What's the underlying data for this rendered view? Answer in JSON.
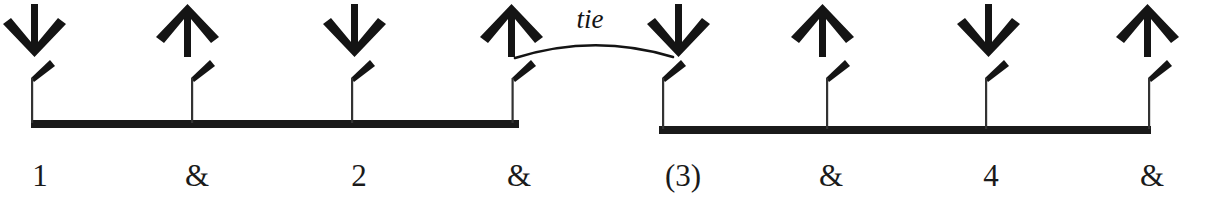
{
  "diagram": {
    "kind": "strumming-rhythm-notation",
    "ink_color": "#1a1a1a",
    "background_color": "#ffffff",
    "tie": {
      "label": "tie",
      "label_x": 590,
      "label_y": 6,
      "from_beat_index": 3,
      "to_beat_index": 4,
      "arc_start_x": 515,
      "arc_start_y": 58,
      "arc_peak_x": 594,
      "arc_peak_y": 40,
      "arc_end_x": 673,
      "arc_end_y": 57
    },
    "beams": [
      {
        "name": "beam-group-1",
        "x1": 31,
        "x2": 519,
        "y": 120,
        "thickness": 8
      },
      {
        "name": "beam-group-2",
        "x1": 659,
        "x2": 1151,
        "y": 126,
        "thickness": 8
      }
    ],
    "beats": [
      {
        "label": "1",
        "stroke": "down",
        "x": 31,
        "beam": 1,
        "label_x": 40,
        "label_y": 160
      },
      {
        "label": "&",
        "stroke": "up",
        "x": 191,
        "beam": 1,
        "label_x": 197,
        "label_y": 160
      },
      {
        "label": "2",
        "stroke": "down",
        "x": 351,
        "beam": 1,
        "label_x": 359,
        "label_y": 160
      },
      {
        "label": "&",
        "stroke": "up",
        "x": 515,
        "beam": 1,
        "label_x": 519,
        "label_y": 160
      },
      {
        "label": "(3)",
        "stroke": "down",
        "x": 662,
        "beam": 2,
        "label_x": 683,
        "label_y": 160
      },
      {
        "label": "&",
        "stroke": "up",
        "x": 826,
        "beam": 2,
        "label_x": 831,
        "label_y": 160
      },
      {
        "label": "4",
        "stroke": "down",
        "x": 985,
        "beam": 2,
        "label_x": 991,
        "label_y": 160
      },
      {
        "label": "&",
        "stroke": "up",
        "x": 1147,
        "beam": 2,
        "label_x": 1152,
        "label_y": 160
      }
    ]
  }
}
